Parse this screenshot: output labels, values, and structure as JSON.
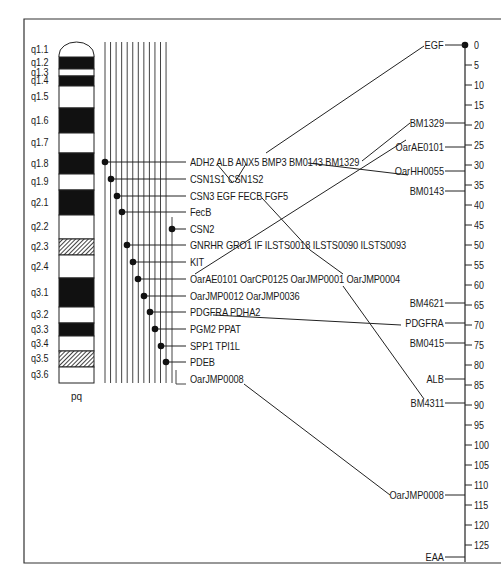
{
  "chromosome": {
    "footer_label": "pq",
    "bands": [
      {
        "label": "q1.1",
        "top": 42,
        "bottom": 57,
        "fill": "arch"
      },
      {
        "label": "q1.2",
        "top": 57,
        "bottom": 69,
        "fill": "black"
      },
      {
        "label": "q1.3",
        "top": 69,
        "bottom": 76,
        "fill": "white"
      },
      {
        "label": "q1.4",
        "top": 76,
        "bottom": 86,
        "fill": "black"
      },
      {
        "label": "q1.5",
        "top": 86,
        "bottom": 108,
        "fill": "white"
      },
      {
        "label": "q1.6",
        "top": 108,
        "bottom": 133,
        "fill": "black"
      },
      {
        "label": "q1.7",
        "top": 133,
        "bottom": 153,
        "fill": "white"
      },
      {
        "label": "q1.8",
        "top": 153,
        "bottom": 174,
        "fill": "black"
      },
      {
        "label": "q1.9",
        "top": 174,
        "bottom": 190,
        "fill": "white"
      },
      {
        "label": "q2.1",
        "top": 190,
        "bottom": 215,
        "fill": "black"
      },
      {
        "label": "q2.2",
        "top": 215,
        "bottom": 239,
        "fill": "white"
      },
      {
        "label": "q2.3",
        "top": 239,
        "bottom": 255,
        "fill": "hatched"
      },
      {
        "label": "q2.4",
        "top": 255,
        "bottom": 278,
        "fill": "white"
      },
      {
        "label": "q3.1",
        "top": 278,
        "bottom": 307,
        "fill": "black"
      },
      {
        "label": "q3.2",
        "top": 307,
        "bottom": 323,
        "fill": "white"
      },
      {
        "label": "q3.3",
        "top": 323,
        "bottom": 336,
        "fill": "black"
      },
      {
        "label": "q3.4",
        "top": 336,
        "bottom": 351,
        "fill": "white"
      },
      {
        "label": "q3.5",
        "top": 351,
        "bottom": 367,
        "fill": "hatched"
      },
      {
        "label": "q3.6",
        "top": 367,
        "bottom": 383,
        "fill": "white"
      }
    ]
  },
  "gene_groups": [
    {
      "label": "ADH2 ALB ANX5 BMP3 BM0143 BM1329",
      "y": 162,
      "dot_x": 105
    },
    {
      "label": "CSN1S1 CSN1S2",
      "y": 179,
      "dot_x": 111
    },
    {
      "label": "CSN3 EGF FECB FGF5",
      "y": 196,
      "dot_x": 117
    },
    {
      "label": "FecB",
      "y": 212,
      "dot_x": 122
    },
    {
      "label": "CSN2",
      "y": 229,
      "dot_x": 172
    },
    {
      "label": "GNRHR GRO1 IF ILSTS0018 ILSTS0090 ILSTS0093",
      "y": 245,
      "dot_x": 127
    },
    {
      "label": "KIT",
      "y": 262,
      "dot_x": 133
    },
    {
      "label": "OarAE0101 OarCP0125 OarJMP0001 OarJMP0004",
      "y": 279,
      "dot_x": 138
    },
    {
      "label": "OarJMP0012 OarJMP0036",
      "y": 296,
      "dot_x": 144
    },
    {
      "label": "PDGFRA PDHA2",
      "y": 312,
      "dot_x": 150
    },
    {
      "label": "PGM2 PPAT",
      "y": 329,
      "dot_x": 155
    },
    {
      "label": "SPP1 TPI1L",
      "y": 346,
      "dot_x": 161
    },
    {
      "label": "PDEB",
      "y": 362,
      "dot_x": 166
    },
    {
      "label": "OarJMP0008",
      "y": 379,
      "dot_x": null
    }
  ],
  "scale": {
    "ticks": [
      "0",
      "5",
      "10",
      "15",
      "20",
      "25",
      "30",
      "35",
      "40",
      "45",
      "50",
      "55",
      "60",
      "65",
      "70",
      "75",
      "80",
      "85",
      "90",
      "95",
      "100",
      "105",
      "110",
      "115",
      "120",
      "125"
    ],
    "markers": [
      {
        "label": "EGF",
        "value": 0
      },
      {
        "label": "BM1329",
        "value": 19.5
      },
      {
        "label": "OarAE0101",
        "value": 25.5
      },
      {
        "label": "OarHH0055",
        "value": 31.5
      },
      {
        "label": "BM0143",
        "value": 36.5
      },
      {
        "label": "BM4621",
        "value": 64.5
      },
      {
        "label": "PDGFRA",
        "value": 69.5
      },
      {
        "label": "BM0415",
        "value": 74.5
      },
      {
        "label": "ALB",
        "value": 83.5
      },
      {
        "label": "BM4311",
        "value": 89.5
      },
      {
        "label": "OarJMP0008",
        "value": 112.5
      },
      {
        "label": "EAA",
        "value": 128
      }
    ]
  }
}
